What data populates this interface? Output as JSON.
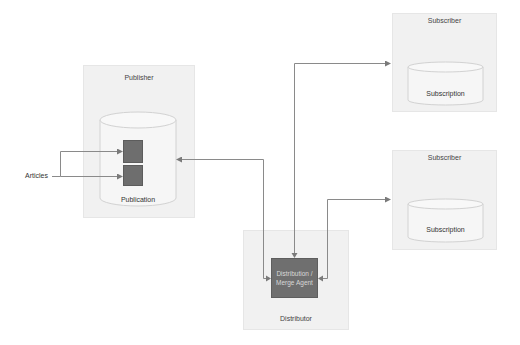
{
  "diagram": {
    "colors": {
      "panel_bg": "#f1f1f1",
      "panel_border": "#e6e6e6",
      "block_dark": "#6e6e6e",
      "connector": "#8a8a8a",
      "cylinder_fill": "#f6f6f6",
      "cylinder_stroke": "#d2d2d2"
    },
    "publisher": {
      "title": "Publisher",
      "database_label": "Publication",
      "article_count": 2
    },
    "articles": {
      "label": "Articles"
    },
    "distributor": {
      "title": "Distributor",
      "agent_label_line1": "Distribution /",
      "agent_label_line2": "Merge Agent"
    },
    "subscribers": [
      {
        "title": "Subscriber",
        "database_label": "Subscription"
      },
      {
        "title": "Subscriber",
        "database_label": "Subscription"
      }
    ],
    "connections": [
      {
        "from": "Articles",
        "to": "Publication article 1"
      },
      {
        "from": "Articles",
        "to": "Publication article 2"
      },
      {
        "from": "Distribution / Merge Agent",
        "to": "Publication"
      },
      {
        "from": "Distribution / Merge Agent",
        "to": "Subscriber 1"
      },
      {
        "from": "Distribution / Merge Agent",
        "to": "Subscriber 2"
      }
    ]
  }
}
